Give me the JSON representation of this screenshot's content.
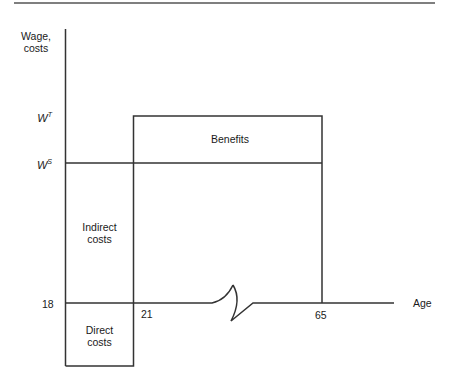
{
  "diagram": {
    "y_axis_label_line1": "Wage,",
    "y_axis_label_line2": "costs",
    "x_axis_label": "Age",
    "y_ticks": [
      {
        "base": "W",
        "sup": "T",
        "level": "trained wage"
      },
      {
        "base": "W",
        "sup": "S",
        "level": "student wage"
      }
    ],
    "x_ticks": [
      "18",
      "21",
      "65"
    ],
    "regions": {
      "benefits": "Benefits",
      "indirect_line1": "Indirect",
      "indirect_line2": "costs",
      "direct_line1": "Direct",
      "direct_line2": "costs"
    },
    "axis_break": "x-axis break between 21 and 65",
    "line_color": "#333333"
  }
}
